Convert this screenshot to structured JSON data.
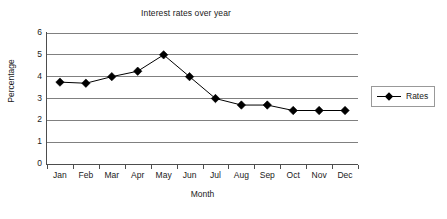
{
  "chart_data": {
    "type": "line",
    "title": "Interest rates over year",
    "xlabel": "Month",
    "ylabel": "Percentage",
    "categories": [
      "Jan",
      "Feb",
      "Mar",
      "Apr",
      "May",
      "Jun",
      "Jul",
      "Aug",
      "Sep",
      "Oct",
      "Nov",
      "Dec"
    ],
    "series": [
      {
        "name": "Rates",
        "values": [
          3.75,
          3.7,
          4.0,
          4.25,
          5.0,
          4.0,
          3.0,
          2.7,
          2.7,
          2.45,
          2.45,
          2.45
        ],
        "color": "#000000",
        "marker": "diamond"
      }
    ],
    "ylim": [
      0,
      6
    ],
    "ytick_step": 1,
    "yticks": [
      "0",
      "1",
      "2",
      "3",
      "4",
      "5",
      "6"
    ],
    "grid": "horizontal",
    "grid_color": "#808080",
    "axis_color": "#4d4d4d",
    "legend_position": "right",
    "legend_entries": [
      "Rates"
    ],
    "background": "#ffffff"
  }
}
